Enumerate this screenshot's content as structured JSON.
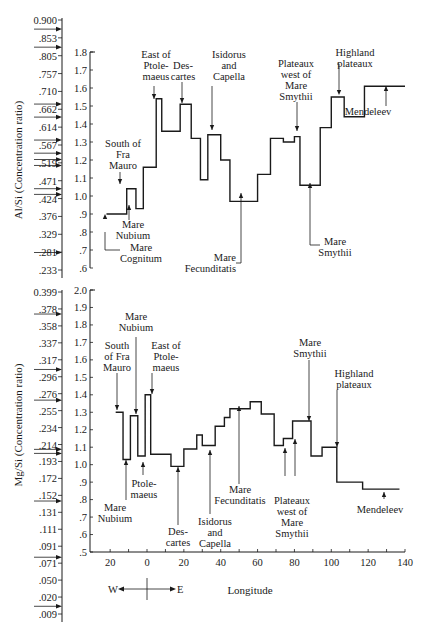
{
  "chart_data": [
    {
      "type": "line",
      "step": true,
      "title": "",
      "ylabel": "Al/Si (Concentration ratio)",
      "xlabel": "Longitude",
      "xlim": [
        -20,
        140
      ],
      "ylim": [
        0.6,
        1.8
      ],
      "yticks": [
        ".6",
        ".7",
        ".8",
        ".9",
        "1.0",
        "1.1",
        "1.2",
        "1.3",
        "1.4",
        "1.5",
        "1.6",
        "1.7",
        "1.8"
      ],
      "secondary_yticks": [
        "0.900",
        ".853",
        ".805",
        ".757",
        ".710",
        ".662",
        ".614",
        ".567",
        ".519",
        ".471",
        ".424",
        ".376",
        ".329",
        ".281",
        ".233"
      ],
      "secondary_arrow_values": [
        0.876,
        0.828,
        0.676,
        0.641,
        0.58,
        0.545,
        0.528,
        0.512,
        0.45,
        0.435,
        0.28
      ],
      "series": [
        {
          "name": "Al/Si",
          "steps": [
            {
              "x0": -22,
              "x1": -11,
              "y": 0.9
            },
            {
              "x0": -11,
              "x1": -6,
              "y": 1.04
            },
            {
              "x0": -6,
              "x1": -2,
              "y": 0.93
            },
            {
              "x0": -2,
              "x1": 5,
              "y": 1.16
            },
            {
              "x0": 5,
              "x1": 8,
              "y": 1.54
            },
            {
              "x0": 8,
              "x1": 18,
              "y": 1.36
            },
            {
              "x0": 18,
              "x1": 24,
              "y": 1.51
            },
            {
              "x0": 24,
              "x1": 29,
              "y": 1.32
            },
            {
              "x0": 29,
              "x1": 33,
              "y": 1.09
            },
            {
              "x0": 33,
              "x1": 40,
              "y": 1.34
            },
            {
              "x0": 40,
              "x1": 45,
              "y": 1.2
            },
            {
              "x0": 45,
              "x1": 60,
              "y": 0.97
            },
            {
              "x0": 60,
              "x1": 67,
              "y": 1.12
            },
            {
              "x0": 67,
              "x1": 74,
              "y": 1.32
            },
            {
              "x0": 74,
              "x1": 80,
              "y": 1.3
            },
            {
              "x0": 80,
              "x1": 83,
              "y": 1.33
            },
            {
              "x0": 83,
              "x1": 94,
              "y": 1.06
            },
            {
              "x0": 94,
              "x1": 100,
              "y": 1.38
            },
            {
              "x0": 100,
              "x1": 107,
              "y": 1.55
            },
            {
              "x0": 107,
              "x1": 118,
              "y": 1.44
            },
            {
              "x0": 118,
              "x1": 140,
              "y": 1.61
            }
          ]
        }
      ],
      "annotations": [
        {
          "id": "south-of-fra-mauro",
          "lines": [
            "South of",
            "Fra",
            "Mauro"
          ]
        },
        {
          "id": "mare-nubium",
          "lines": [
            "Mare",
            "Nubium"
          ]
        },
        {
          "id": "mare-cognitum",
          "lines": [
            "Mare",
            "Cognitum"
          ]
        },
        {
          "id": "east-of-ptolemaeus",
          "lines": [
            "East of",
            "Ptole-",
            "maeus"
          ]
        },
        {
          "id": "descartes",
          "lines": [
            "Des-",
            "cartes"
          ]
        },
        {
          "id": "isidorus-and-capella",
          "lines": [
            "Isidorus",
            "and",
            "Capella"
          ]
        },
        {
          "id": "mare-fecunditatis",
          "lines": [
            "Mare",
            "Fecunditatis"
          ]
        },
        {
          "id": "plateaux-west-of-mare-smythii",
          "lines": [
            "Plateaux",
            "west of",
            "Mare",
            "Smythii"
          ]
        },
        {
          "id": "mare-smythii",
          "lines": [
            "Mare",
            "Smythii"
          ]
        },
        {
          "id": "highland-plateaux",
          "lines": [
            "Highland",
            "plateaux"
          ]
        },
        {
          "id": "mendeleev",
          "lines": [
            "Mendeleev"
          ]
        }
      ]
    },
    {
      "type": "line",
      "step": true,
      "title": "",
      "ylabel": "Mg/Si (Concentration ratio)",
      "xlabel": "Longitude",
      "xlim": [
        -20,
        140
      ],
      "ylim": [
        0.5,
        2.0
      ],
      "xticks": [
        "20",
        "0",
        "20",
        "40",
        "60",
        "80",
        "100",
        "120",
        "140"
      ],
      "yticks": [
        ".5",
        ".6",
        ".7",
        ".8",
        ".9",
        "1.0",
        "1.1",
        "1.2",
        "1.3",
        "1.4",
        "1.5",
        "1.6",
        "1.7",
        "1.8",
        "1.9",
        "2.0"
      ],
      "secondary_yticks": [
        "0.399",
        ".378",
        ".358",
        ".337",
        ".317",
        ".296",
        ".276",
        ".255",
        ".234",
        ".214",
        ".193",
        ".172",
        ".152",
        ".131",
        ".111",
        ".091",
        ".071",
        ".050",
        ".020",
        ".009"
      ],
      "secondary_arrow_values": [
        0.372,
        0.305,
        0.268,
        0.208,
        0.203,
        0.145,
        0.078,
        0.014
      ],
      "series": [
        {
          "name": "Mg/Si",
          "steps": [
            {
              "x0": -17,
              "x1": -13,
              "y": 1.3
            },
            {
              "x0": -13,
              "x1": -9,
              "y": 1.03
            },
            {
              "x0": -9,
              "x1": -5,
              "y": 1.28
            },
            {
              "x0": -5,
              "x1": -1,
              "y": 1.05
            },
            {
              "x0": -1,
              "x1": 2,
              "y": 1.4
            },
            {
              "x0": 2,
              "x1": 13,
              "y": 1.06
            },
            {
              "x0": 13,
              "x1": 20,
              "y": 0.99
            },
            {
              "x0": 20,
              "x1": 27,
              "y": 1.09
            },
            {
              "x0": 27,
              "x1": 30,
              "y": 1.17
            },
            {
              "x0": 30,
              "x1": 37,
              "y": 1.11
            },
            {
              "x0": 37,
              "x1": 42,
              "y": 1.22
            },
            {
              "x0": 42,
              "x1": 45,
              "y": 1.27
            },
            {
              "x0": 45,
              "x1": 56,
              "y": 1.32
            },
            {
              "x0": 56,
              "x1": 62,
              "y": 1.36
            },
            {
              "x0": 62,
              "x1": 69,
              "y": 1.29
            },
            {
              "x0": 69,
              "x1": 74,
              "y": 1.11
            },
            {
              "x0": 74,
              "x1": 79,
              "y": 1.15
            },
            {
              "x0": 79,
              "x1": 89,
              "y": 1.25
            },
            {
              "x0": 89,
              "x1": 95,
              "y": 1.05
            },
            {
              "x0": 95,
              "x1": 103,
              "y": 1.1
            },
            {
              "x0": 103,
              "x1": 117,
              "y": 0.9
            },
            {
              "x0": 117,
              "x1": 137,
              "y": 0.86
            }
          ]
        }
      ],
      "annotations": [
        {
          "id": "south-of-fra-mauro",
          "lines": [
            "South",
            "of Fra",
            "Mauro"
          ]
        },
        {
          "id": "mare-nubium-top",
          "lines": [
            "Mare",
            "Nubium"
          ]
        },
        {
          "id": "east-of-ptolemaeus",
          "lines": [
            "East of",
            "Ptole-",
            "maeus"
          ]
        },
        {
          "id": "ptolemaeus",
          "lines": [
            "Ptole-",
            "maeus"
          ]
        },
        {
          "id": "mare-nubium-bottom",
          "lines": [
            "Mare",
            "Nubium"
          ]
        },
        {
          "id": "descartes",
          "lines": [
            "Des-",
            "cartes"
          ]
        },
        {
          "id": "isidorus-and-capella",
          "lines": [
            "Isidorus",
            "and",
            "Capella"
          ]
        },
        {
          "id": "mare-fecunditatis",
          "lines": [
            "Mare",
            "Fecunditatis"
          ]
        },
        {
          "id": "plateaux-west-of-mare-smythii",
          "lines": [
            "Plateaux",
            "west of",
            "Mare",
            "Smythii"
          ]
        },
        {
          "id": "mare-smythii",
          "lines": [
            "Mare",
            "Smythii"
          ]
        },
        {
          "id": "highland-plateaux",
          "lines": [
            "Highland",
            "plateaux"
          ]
        },
        {
          "id": "mendeleev",
          "lines": [
            "Mendeleev"
          ]
        }
      ]
    }
  ],
  "direction_indicator": {
    "west": "W",
    "east": "E"
  }
}
